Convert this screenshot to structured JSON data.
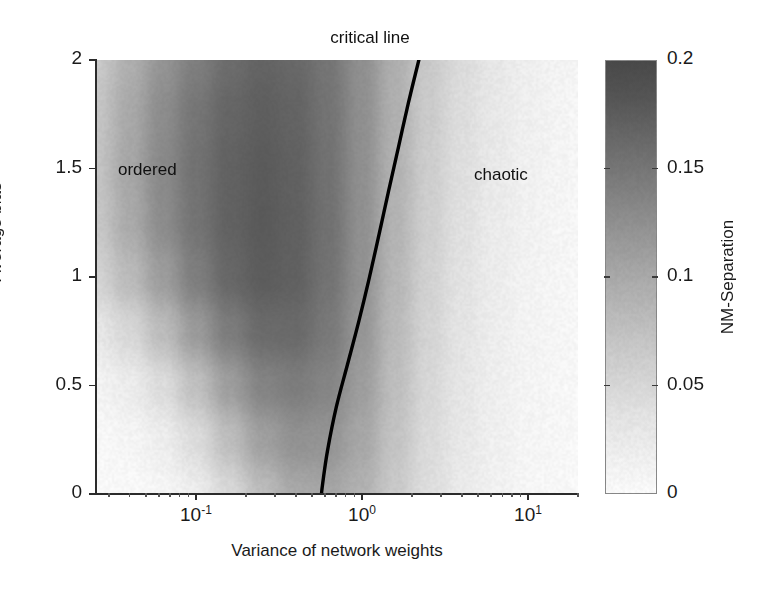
{
  "figure": {
    "title": "",
    "background": "#ffffff"
  },
  "annotations": {
    "critical_line": "critical line",
    "ordered": "ordered",
    "chaotic": "chaotic"
  },
  "axes": {
    "x_title": "Variance of network weights",
    "y_title": "Average bias",
    "x_ticks": [
      {
        "label_mantissa": "10",
        "label_exp": "-1",
        "value": 0.1,
        "px": 208
      },
      {
        "label_mantissa": "10",
        "label_exp": "0",
        "value": 1,
        "px": 365
      },
      {
        "label_mantissa": "10",
        "label_exp": "1",
        "value": 10,
        "px": 525
      }
    ],
    "y_ticks": [
      {
        "label": "0",
        "value": 0
      },
      {
        "label": "0.5",
        "value": 0.5
      },
      {
        "label": "1",
        "value": 1
      },
      {
        "label": "1.5",
        "value": 1.5
      },
      {
        "label": "2",
        "value": 2
      }
    ]
  },
  "colorbar": {
    "title": "NM-Separation",
    "min": 0,
    "max": 0.2,
    "ticks": [
      "0",
      "0.05",
      "0.1",
      "0.15",
      "0.2"
    ],
    "tick_values": [
      0,
      0.05,
      0.1,
      0.15,
      0.2
    ],
    "colormap": "reversed-grayscale",
    "low_color": "#ffffff",
    "high_color": "#4a4a4a"
  },
  "chart_data": {
    "type": "heatmap",
    "title": "",
    "xlabel": "Variance of network weights",
    "ylabel": "Average bias",
    "xscale": "log",
    "yscale": "linear",
    "xlim": [
      0.025,
      20
    ],
    "ylim": [
      0,
      2
    ],
    "grid": false,
    "colorbar_label": "NM-Separation",
    "zlim": [
      0,
      0.2
    ],
    "colormap": "reversed-grayscale",
    "x_tick_labels": [
      "10^-1",
      "10^0",
      "10^1"
    ],
    "y_tick_labels": [
      "0",
      "0.5",
      "1",
      "1.5",
      "2"
    ],
    "x_grid_values": [
      0.025,
      0.04,
      0.063,
      0.1,
      0.158,
      0.251,
      0.398,
      0.631,
      1.0,
      1.585,
      2.512,
      3.981,
      6.31,
      10.0,
      15.85,
      20.0
    ],
    "y_grid_values": [
      0,
      0.25,
      0.5,
      0.75,
      1.0,
      1.25,
      1.5,
      1.75,
      2.0
    ],
    "z_values": [
      [
        0.055,
        0.085,
        0.115,
        0.14,
        0.16,
        0.17,
        0.165,
        0.15,
        0.12,
        0.085,
        0.055,
        0.035,
        0.022,
        0.013,
        0.008,
        0.006
      ],
      [
        0.06,
        0.092,
        0.124,
        0.15,
        0.168,
        0.176,
        0.17,
        0.152,
        0.121,
        0.084,
        0.053,
        0.033,
        0.02,
        0.012,
        0.007,
        0.005
      ],
      [
        0.062,
        0.095,
        0.128,
        0.154,
        0.172,
        0.18,
        0.173,
        0.154,
        0.121,
        0.082,
        0.051,
        0.031,
        0.019,
        0.011,
        0.007,
        0.005
      ],
      [
        0.058,
        0.09,
        0.124,
        0.152,
        0.172,
        0.181,
        0.174,
        0.155,
        0.12,
        0.08,
        0.049,
        0.029,
        0.017,
        0.01,
        0.006,
        0.004
      ],
      [
        0.045,
        0.072,
        0.106,
        0.14,
        0.166,
        0.178,
        0.173,
        0.153,
        0.118,
        0.077,
        0.046,
        0.027,
        0.016,
        0.009,
        0.005,
        0.004
      ],
      [
        0.022,
        0.04,
        0.07,
        0.108,
        0.142,
        0.162,
        0.163,
        0.146,
        0.113,
        0.073,
        0.043,
        0.025,
        0.014,
        0.008,
        0.005,
        0.003
      ],
      [
        0.008,
        0.016,
        0.034,
        0.066,
        0.104,
        0.134,
        0.142,
        0.132,
        0.105,
        0.068,
        0.04,
        0.023,
        0.013,
        0.007,
        0.004,
        0.003
      ],
      [
        0.003,
        0.006,
        0.014,
        0.034,
        0.068,
        0.102,
        0.118,
        0.115,
        0.094,
        0.062,
        0.036,
        0.021,
        0.012,
        0.006,
        0.004,
        0.002
      ],
      [
        0.001,
        0.002,
        0.005,
        0.015,
        0.038,
        0.07,
        0.092,
        0.096,
        0.082,
        0.055,
        0.032,
        0.018,
        0.01,
        0.005,
        0.003,
        0.002
      ]
    ],
    "overlay_curves": [
      {
        "name": "critical line",
        "style": "solid-black",
        "linewidth": 3,
        "points": [
          {
            "x": 2.2,
            "y": 2.0
          },
          {
            "x": 1.9,
            "y": 1.8
          },
          {
            "x": 1.66,
            "y": 1.6
          },
          {
            "x": 1.45,
            "y": 1.4
          },
          {
            "x": 1.27,
            "y": 1.2
          },
          {
            "x": 1.11,
            "y": 1.0
          },
          {
            "x": 0.96,
            "y": 0.8
          },
          {
            "x": 0.82,
            "y": 0.6
          },
          {
            "x": 0.7,
            "y": 0.4
          },
          {
            "x": 0.62,
            "y": 0.2
          },
          {
            "x": 0.58,
            "y": 0.05
          },
          {
            "x": 0.57,
            "y": 0.0
          }
        ]
      }
    ]
  }
}
